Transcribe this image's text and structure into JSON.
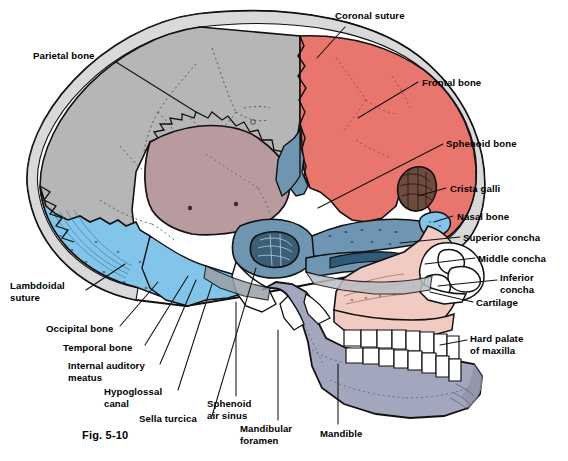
{
  "figure": {
    "caption": "Fig. 5-10",
    "type": "anatomical-illustration"
  },
  "palette": {
    "parietal_gray": "#b6b6b6",
    "frontal_coral": "#e8766c",
    "occipital_blue": "#81c6ea",
    "temporal_rose": "#b89a9f",
    "sphenoid_steel": "#6e96b2",
    "maxilla_pink": "#f1cbc2",
    "mandible_bluegray": "#a2a7bd",
    "tooth_white": "#ffffff",
    "cartilage_white": "#ffffff",
    "outline": "#111111",
    "label_text": "#000000",
    "leader_line": "#111111",
    "background": "#ffffff"
  },
  "labels": [
    {
      "id": "parietal-bone",
      "text": "Parietal bone",
      "x": 33,
      "y": 50,
      "side": "left",
      "leader": [
        [
          116,
          62
        ],
        [
          196,
          112
        ]
      ]
    },
    {
      "id": "coronal-suture",
      "text": "Coronal suture",
      "x": 335,
      "y": 10,
      "side": "right",
      "leader": [
        [
          345,
          27
        ],
        [
          317,
          58
        ]
      ]
    },
    {
      "id": "frontal-bone",
      "text": "Frontal bone",
      "x": 422,
      "y": 77,
      "side": "right",
      "leader": [
        [
          418,
          82
        ],
        [
          358,
          118
        ]
      ]
    },
    {
      "id": "sphenoid-bone",
      "text": "Sphenoid bone",
      "x": 446,
      "y": 138,
      "side": "right",
      "leader": [
        [
          443,
          144
        ],
        [
          318,
          208
        ]
      ]
    },
    {
      "id": "crista-galli",
      "text": "Crista galli",
      "x": 450,
      "y": 183,
      "side": "right",
      "leader": [
        [
          446,
          188
        ],
        [
          418,
          196
        ]
      ]
    },
    {
      "id": "nasal-bone",
      "text": "Nasal bone",
      "x": 457,
      "y": 211,
      "side": "right",
      "leader": [
        [
          453,
          216
        ],
        [
          434,
          222
        ]
      ]
    },
    {
      "id": "superior-concha",
      "text": "Superior concha",
      "x": 463,
      "y": 232,
      "side": "right",
      "leader": [
        [
          460,
          237
        ],
        [
          400,
          243
        ]
      ]
    },
    {
      "id": "middle-concha",
      "text": "Middle concha",
      "x": 478,
      "y": 253,
      "side": "right",
      "leader": [
        [
          475,
          258
        ],
        [
          425,
          264
        ]
      ]
    },
    {
      "id": "inferior-concha",
      "text": "Inferior\nconcha",
      "x": 500,
      "y": 272,
      "side": "right",
      "leader": [
        [
          497,
          280
        ],
        [
          438,
          286
        ]
      ]
    },
    {
      "id": "cartilage",
      "text": "Cartilage",
      "x": 476,
      "y": 297,
      "side": "right",
      "leader": [
        [
          473,
          302
        ],
        [
          430,
          292
        ]
      ]
    },
    {
      "id": "hard-palate-maxilla",
      "text": "Hard palate\nof maxilla",
      "x": 470,
      "y": 333,
      "side": "right",
      "leader": [
        [
          467,
          340
        ],
        [
          440,
          345
        ]
      ]
    },
    {
      "id": "lambdoidal-suture",
      "text": "Lambdoidal\nsuture",
      "x": 10,
      "y": 280,
      "side": "left",
      "leader": [
        [
          86,
          290
        ],
        [
          125,
          264
        ]
      ]
    },
    {
      "id": "occipital-bone",
      "text": "Occipital bone",
      "x": 46,
      "y": 323,
      "side": "left",
      "leader": [
        [
          120,
          326
        ],
        [
          158,
          282
        ]
      ]
    },
    {
      "id": "temporal-bone",
      "text": "Temporal bone",
      "x": 63,
      "y": 342,
      "side": "left",
      "leader": [
        [
          145,
          345
        ],
        [
          188,
          276
        ]
      ]
    },
    {
      "id": "internal-auditory-meatus",
      "text": "Internal auditory\nmeatus",
      "x": 68,
      "y": 360,
      "side": "left",
      "leader": [
        [
          160,
          364
        ],
        [
          196,
          280
        ]
      ]
    },
    {
      "id": "hypoglossal-canal",
      "text": "Hypoglossal\ncanal",
      "x": 104,
      "y": 386,
      "side": "left",
      "leader": [
        [
          178,
          390
        ],
        [
          212,
          284
        ]
      ]
    },
    {
      "id": "sella-turcica",
      "text": "Sella turcica",
      "x": 139,
      "y": 413,
      "side": "left",
      "leader": [
        [
          212,
          416
        ],
        [
          256,
          268
        ]
      ]
    },
    {
      "id": "sphenoid-air-sinus",
      "text": "Sphenoid\nair sinus",
      "x": 207,
      "y": 398,
      "side": "left",
      "leader": [
        [
          236,
          396
        ],
        [
          236,
          302
        ]
      ]
    },
    {
      "id": "mandibular-foramen",
      "text": "Mandibular\nforamen",
      "x": 240,
      "y": 423,
      "side": "left",
      "leader": [
        [
          278,
          420
        ],
        [
          278,
          330
        ]
      ]
    },
    {
      "id": "mandible",
      "text": "Mandible",
      "x": 320,
      "y": 428,
      "side": "left",
      "leader": [
        [
          338,
          424
        ],
        [
          338,
          364
        ]
      ]
    }
  ],
  "regions": [
    {
      "id": "parietal-bone-region",
      "name": "Parietal bone",
      "color": "#b6b6b6"
    },
    {
      "id": "frontal-bone-region",
      "name": "Frontal bone",
      "color": "#e8766c"
    },
    {
      "id": "occipital-bone-region",
      "name": "Occipital bone",
      "color": "#81c6ea"
    },
    {
      "id": "temporal-bone-region",
      "name": "Temporal bone",
      "color": "#b89a9f"
    },
    {
      "id": "sphenoid-bone-region",
      "name": "Sphenoid bone",
      "color": "#6e96b2"
    },
    {
      "id": "maxilla-region",
      "name": "Maxilla",
      "color": "#f1cbc2"
    },
    {
      "id": "mandible-region",
      "name": "Mandible",
      "color": "#a2a7bd"
    },
    {
      "id": "teeth-region",
      "name": "Teeth",
      "color": "#ffffff"
    },
    {
      "id": "nasal-cartilage-region",
      "name": "Nasal cartilage",
      "color": "#ffffff"
    }
  ]
}
